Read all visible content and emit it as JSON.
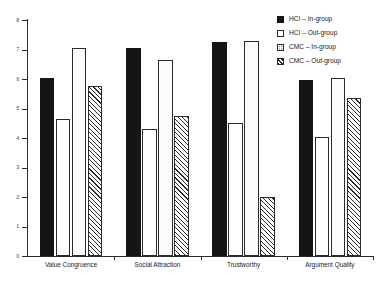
{
  "chart_data": {
    "type": "bar",
    "title": "",
    "subtitle": "",
    "xlabel": "",
    "ylabel": "",
    "ylim": [
      0,
      8
    ],
    "yticks": [
      0,
      1,
      2,
      3,
      4,
      5,
      6,
      7,
      8
    ],
    "ytick_labels": [
      "0",
      "1",
      "2",
      "3",
      "4",
      "5",
      "6",
      "7",
      "8"
    ],
    "grid": false,
    "legend_position": "top-right",
    "categories": [
      "Value Congruence",
      "Social Attraction",
      "Trustworthy",
      "Argument Quality"
    ],
    "series": [
      {
        "name": "HCI – In-group",
        "fill": "solid-black",
        "color": "#151515",
        "values": [
          6.05,
          7.05,
          7.25,
          5.95
        ]
      },
      {
        "name": "HCI – Out-group",
        "fill": "open-white",
        "color": "#ffffff",
        "values": [
          4.65,
          4.3,
          4.5,
          4.05
        ]
      },
      {
        "name": "CMC – In-group",
        "fill": "dotted",
        "color": "#fbfbfb",
        "values": [
          7.05,
          6.65,
          7.3,
          6.05
        ]
      },
      {
        "name": "CMC – Out-group",
        "fill": "diagonal-hatch",
        "color": "#ffffff",
        "values": [
          5.75,
          4.75,
          2.0,
          5.35
        ]
      }
    ]
  },
  "legend": {
    "items": [
      {
        "label": "HCI – In-group",
        "swatch": "solid"
      },
      {
        "label": "HCI – Out-group",
        "swatch": "open"
      },
      {
        "label": "CMC – In-group",
        "swatch": "dotted"
      },
      {
        "label": "CMC – Out-group",
        "swatch": "hatched"
      }
    ]
  },
  "axis": {
    "y_labels": [
      "8",
      "7",
      "6",
      "5",
      "4",
      "3",
      "2",
      "1",
      "0"
    ]
  }
}
